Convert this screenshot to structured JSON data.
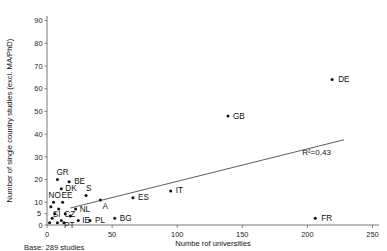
{
  "chart_data": {
    "type": "scatter",
    "title": "",
    "xlabel": "Numbe rof universities",
    "ylabel": "Number of single country studies (excl. MA/PhD)",
    "xlim": [
      0,
      255
    ],
    "ylim": [
      0,
      92
    ],
    "xticks": [
      0,
      50,
      100,
      150,
      200,
      250
    ],
    "xticklabels": [
      "0",
      "50",
      "100",
      "150",
      "200",
      "250"
    ],
    "yticks": [
      0,
      5,
      10,
      20,
      30,
      40,
      50,
      60,
      70,
      80,
      90
    ],
    "yticklabels": [
      "0",
      "5",
      "10",
      "20",
      "30",
      "40",
      "50",
      "60",
      "70",
      "80",
      "90"
    ],
    "grid": false,
    "legend": "none",
    "points": [
      {
        "label": "DE",
        "x": 219,
        "y": 64,
        "label_dx": 6,
        "label_dy": 2.5
      },
      {
        "label": "GB",
        "x": 139,
        "y": 48,
        "label_dx": 5,
        "label_dy": 3.5
      },
      {
        "label": "FR",
        "x": 206,
        "y": 3,
        "label_dx": 6,
        "label_dy": 2.5
      },
      {
        "label": "IT",
        "x": 95,
        "y": 15,
        "label_dx": 5,
        "label_dy": 2.5
      },
      {
        "label": "ES",
        "x": 66,
        "y": 12,
        "label_dx": 5,
        "label_dy": 2.5
      },
      {
        "label": "BG",
        "x": 52,
        "y": 3,
        "label_dx": 5,
        "label_dy": 2.5
      },
      {
        "label": "A",
        "x": 41,
        "y": 11,
        "label_dx": 2,
        "label_dy": 9
      },
      {
        "label": "S",
        "x": 30,
        "y": 13,
        "label_dx": 0,
        "label_dy": -4
      },
      {
        "label": "PL",
        "x": 33,
        "y": 2,
        "label_dx": 5,
        "label_dy": 2.5
      },
      {
        "label": "IE",
        "x": 24,
        "y": 2,
        "label_dx": 4,
        "label_dy": 3
      },
      {
        "label": "NL",
        "x": 22,
        "y": 7,
        "label_dx": 4,
        "label_dy": 2.5
      },
      {
        "label": "BE",
        "x": 17,
        "y": 19,
        "label_dx": 5,
        "label_dy": 2.5
      },
      {
        "label": "DK",
        "x": 11,
        "y": 16,
        "label_dx": 4,
        "label_dy": 2.5
      },
      {
        "label": "GR",
        "x": 8,
        "y": 20,
        "label_dx": -1,
        "label_dy": -5
      },
      {
        "label": "EE",
        "x": 12,
        "y": 10,
        "label_dx": -1,
        "label_dy": -4
      },
      {
        "label": "NO",
        "x": 5,
        "y": 10,
        "label_dx": -5,
        "label_dy": -4
      },
      {
        "label": "CZ",
        "x": 14,
        "y": 5,
        "label_dx": -1,
        "label_dy": 3
      },
      {
        "label": "SI",
        "x": 6,
        "y": 5,
        "label_dx": -2,
        "label_dy": 3
      },
      {
        "label": "PT",
        "x": 13,
        "y": 1,
        "label_dx": 0,
        "label_dy": 5
      },
      {
        "label": "",
        "x": 3,
        "y": 8,
        "label_dx": 0,
        "label_dy": 0
      },
      {
        "label": "",
        "x": 9,
        "y": 7,
        "label_dx": 0,
        "label_dy": 0
      },
      {
        "label": "",
        "x": 4,
        "y": 3,
        "label_dx": 0,
        "label_dy": 0
      },
      {
        "label": "",
        "x": 8,
        "y": 1,
        "label_dx": 0,
        "label_dy": 0
      },
      {
        "label": "",
        "x": 18,
        "y": 4,
        "label_dx": 0,
        "label_dy": 0
      },
      {
        "label": "",
        "x": 2,
        "y": 1,
        "label_dx": 0,
        "label_dy": 0
      },
      {
        "label": "",
        "x": 11,
        "y": 2,
        "label_dx": 0,
        "label_dy": 0
      }
    ],
    "trendline": {
      "x0": 18,
      "y0": 7.5,
      "x1": 228,
      "y1": 37.5
    },
    "annotations": [
      {
        "name": "r-squared",
        "text": "R²=0,43",
        "x": 196,
        "y": 31
      }
    ],
    "caption": "Base: 289 studies"
  },
  "colors": {
    "point": "#111111",
    "axis": "#555555",
    "trend": "#333333",
    "text": "#111111",
    "background": "#ffffff"
  }
}
